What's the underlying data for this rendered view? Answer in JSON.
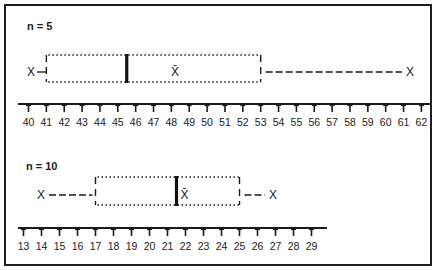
{
  "chart_data": [
    {
      "type": "boxplot",
      "title": "n = 5",
      "axis": {
        "min": 40,
        "max": 62,
        "ticks": [
          40,
          41,
          42,
          43,
          44,
          45,
          46,
          47,
          48,
          49,
          50,
          51,
          52,
          53,
          54,
          55,
          56,
          57,
          58,
          59,
          60,
          61,
          62
        ]
      },
      "min": 41,
      "q1": 41,
      "median": 45.5,
      "mean": 48.2,
      "q3": 53,
      "max": 61,
      "outlier_markers": {
        "low": "X",
        "high": "X"
      },
      "mean_symbol": "X̄"
    },
    {
      "type": "boxplot",
      "title": "n = 10",
      "axis": {
        "min": 13,
        "max": 29,
        "ticks": [
          13,
          14,
          15,
          16,
          17,
          18,
          19,
          20,
          21,
          22,
          23,
          24,
          25,
          26,
          27,
          28,
          29
        ]
      },
      "min": 14,
      "q1": 17,
      "median": 21.5,
      "mean": 21.7,
      "q3": 25,
      "max": 26.7,
      "outlier_markers": {
        "low": "X",
        "high": "X"
      },
      "mean_symbol": "X̄"
    }
  ],
  "labels": {
    "panel1_n": "n = 5",
    "panel2_n": "n = 10",
    "x_marker": "X",
    "mean_marker": "X̄"
  }
}
